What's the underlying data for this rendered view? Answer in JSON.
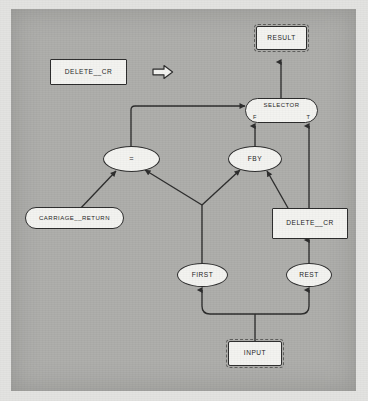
{
  "diagram": {
    "type": "dataflow-graph",
    "background_color": "#adadaa",
    "node_fill_color": "#f3f3f0",
    "line_color": "#2b2b2b",
    "annotation": {
      "definition_label": "DELETE__CR",
      "arrow_icon": "right-block-arrow",
      "meaning": "is defined as"
    },
    "nodes": [
      {
        "id": "definition",
        "label": "DELETE__CR",
        "shape": "rectangle",
        "role": "definition-header"
      },
      {
        "id": "result",
        "label": "RESULT",
        "shape": "terminal",
        "role": "output-terminal"
      },
      {
        "id": "selector",
        "label": "SELECTOR",
        "shape": "stadium",
        "role": "operator",
        "ports": [
          {
            "id": "f",
            "label": "F"
          },
          {
            "id": "t",
            "label": "T"
          }
        ]
      },
      {
        "id": "equals",
        "label": "=",
        "shape": "ellipse",
        "role": "operator"
      },
      {
        "id": "fby",
        "label": "FBY",
        "shape": "ellipse",
        "role": "operator"
      },
      {
        "id": "carriage_return",
        "label": "CARRIAGE__RETURN",
        "shape": "stadium",
        "role": "constant"
      },
      {
        "id": "delete_cr_rec",
        "label": "DELETE__CR",
        "shape": "rectangle",
        "role": "recursive-call"
      },
      {
        "id": "first",
        "label": "FIRST",
        "shape": "ellipse",
        "role": "operator"
      },
      {
        "id": "rest",
        "label": "REST",
        "shape": "ellipse",
        "role": "operator"
      },
      {
        "id": "input",
        "label": "INPUT",
        "shape": "terminal",
        "role": "input-terminal"
      }
    ],
    "edges": [
      {
        "from": "selector",
        "to": "result",
        "port": ""
      },
      {
        "from": "equals",
        "to": "selector",
        "port": ""
      },
      {
        "from": "fby",
        "to": "selector",
        "port": "F"
      },
      {
        "from": "delete_cr_rec",
        "to": "selector",
        "port": "T"
      },
      {
        "from": "carriage_return",
        "to": "equals",
        "port": ""
      },
      {
        "from": "first",
        "to": "equals",
        "port": ""
      },
      {
        "from": "first",
        "to": "fby",
        "port": ""
      },
      {
        "from": "delete_cr_rec",
        "to": "fby",
        "port": ""
      },
      {
        "from": "rest",
        "to": "delete_cr_rec",
        "port": ""
      },
      {
        "from": "input",
        "to": "first",
        "port": ""
      },
      {
        "from": "input",
        "to": "rest",
        "port": ""
      }
    ]
  }
}
